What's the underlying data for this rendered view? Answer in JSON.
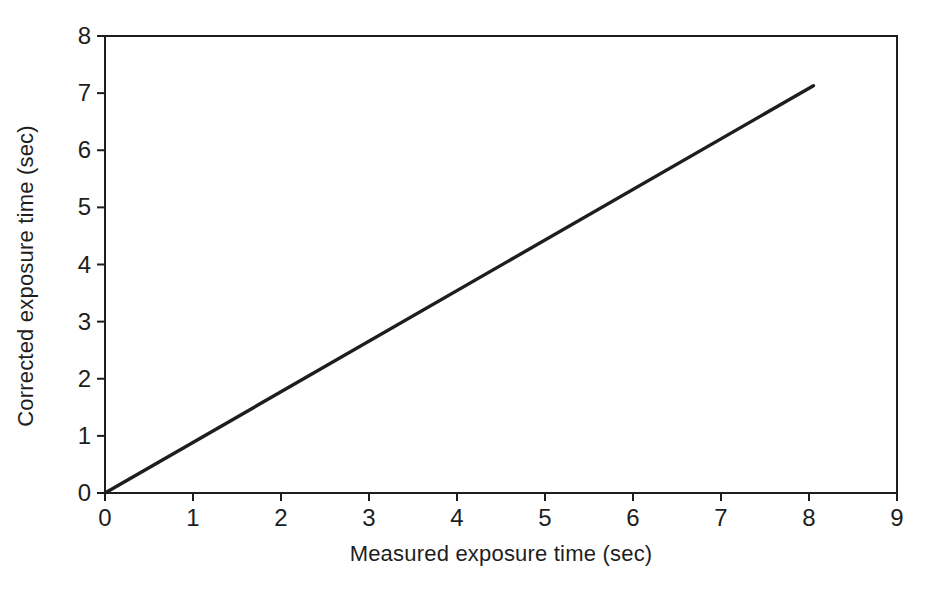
{
  "colors": {
    "ink": "#1e1e1e",
    "background": "#ffffff"
  },
  "chart_data": {
    "type": "line",
    "title": "",
    "xlabel": "Measured exposure time (sec)",
    "ylabel": "Corrected exposure time (sec)",
    "xlim": [
      0,
      9
    ],
    "ylim": [
      0,
      8
    ],
    "x_ticks": [
      0,
      1,
      2,
      3,
      4,
      5,
      6,
      7,
      8,
      9
    ],
    "y_ticks": [
      0,
      1,
      2,
      3,
      4,
      5,
      6,
      7,
      8
    ],
    "grid": false,
    "legend": "none",
    "plot_box": true,
    "tick_direction": "out",
    "series": [
      {
        "name": "exposure-correction-line",
        "x": [
          0,
          8.05
        ],
        "y": [
          0,
          7.13
        ]
      }
    ]
  }
}
